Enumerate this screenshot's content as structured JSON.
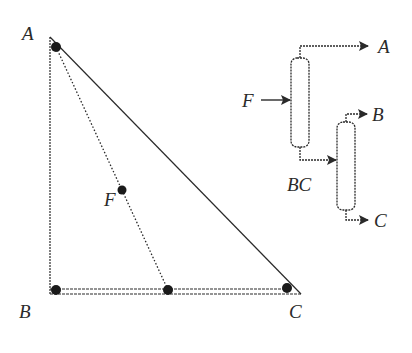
{
  "diagram": {
    "type": "ternary-separation",
    "triangle": {
      "vertices": [
        {
          "id": "A",
          "label": "A"
        },
        {
          "id": "B",
          "label": "B"
        },
        {
          "id": "C",
          "label": "C"
        }
      ],
      "feed_label": "F",
      "points": [
        "A",
        "F",
        "BC",
        "B",
        "C"
      ]
    },
    "flowsheet": {
      "feed_label": "F",
      "column1_top_product": "A",
      "column1_bottom_product": "BC",
      "column2_top_product": "B",
      "column2_bottom_product": "C"
    },
    "colors": {
      "line": "#2a2a2a",
      "dot": "#1a1a1a",
      "background": "#ffffff"
    }
  }
}
